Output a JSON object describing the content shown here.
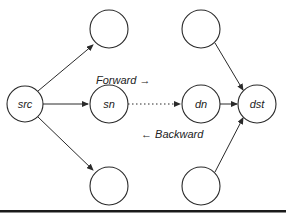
{
  "colors": {
    "stroke": "#2a2a2a",
    "background": "#ffffff",
    "rule": "#1a1a1a"
  },
  "nodes": {
    "src": {
      "label": "src"
    },
    "sn": {
      "label": "sn"
    },
    "dn": {
      "label": "dn"
    },
    "dst": {
      "label": "dst"
    },
    "top_left": {
      "label": ""
    },
    "top_right": {
      "label": ""
    },
    "bottom_left": {
      "label": ""
    },
    "bottom_right": {
      "label": ""
    }
  },
  "annotations": {
    "forward": "Forward →",
    "backward": "← Backward"
  }
}
